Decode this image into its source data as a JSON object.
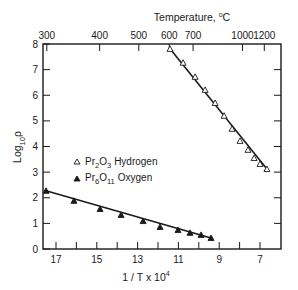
{
  "chart_data": {
    "type": "scatter",
    "title": "",
    "top_axis_label": "Temperature, °C",
    "top_axis_label_base": "Temperature, ",
    "top_axis_label_sup": "o",
    "top_axis_label_unit": "C",
    "top_ticks": [
      {
        "label": "300",
        "inv_T": 17.45
      },
      {
        "label": "400",
        "inv_T": 14.86
      },
      {
        "label": "500",
        "inv_T": 12.94
      },
      {
        "label": "600",
        "inv_T": 11.45
      },
      {
        "label": "700",
        "inv_T": 10.28
      },
      {
        "label": "1000",
        "inv_T": 7.86
      },
      {
        "label": "1200",
        "inv_T": 6.79
      }
    ],
    "xlabel": "1 / T x 10",
    "xlabel_sup": "4",
    "ylabel_base": "Log",
    "ylabel_sub": "10",
    "ylabel_sym": "ρ",
    "ylabel": "Log10 ρ",
    "xlim": [
      17.5,
      6.0
    ],
    "ylim": [
      0,
      8
    ],
    "x_ticks": [
      17,
      16,
      15,
      14,
      13,
      12,
      11,
      10,
      9,
      8,
      7
    ],
    "x_tick_labels": [
      "17",
      "15",
      "13",
      "11",
      "9",
      "7"
    ],
    "y_ticks": [
      0,
      1,
      2,
      3,
      4,
      5,
      6,
      7,
      8
    ],
    "y_tick_labels": [
      "0",
      "1",
      "2",
      "3",
      "4",
      "5",
      "6",
      "7",
      "8"
    ],
    "grid": false,
    "legend_position": "center-left",
    "series": [
      {
        "name": "Pr2O3 Hydrogen",
        "legend_formula": [
          "Pr",
          "2",
          "O",
          "3"
        ],
        "legend_gas": "Hydrogen",
        "marker": "open-triangle",
        "x": [
          11.41,
          10.77,
          10.18,
          9.69,
          9.2,
          8.76,
          8.37,
          7.98,
          7.59,
          7.29,
          7.0,
          6.66
        ],
        "y": [
          7.81,
          7.27,
          6.72,
          6.21,
          5.7,
          5.2,
          4.69,
          4.22,
          3.87,
          3.55,
          3.32,
          3.12
        ]
      },
      {
        "name": "Pr6O11 Oxygen",
        "legend_formula": [
          "Pr",
          "6",
          "O",
          "11"
        ],
        "legend_gas": "Oxygen",
        "marker": "filled-triangle",
        "x": [
          17.49,
          16.12,
          14.84,
          13.81,
          12.73,
          11.9,
          11.02,
          10.43,
          9.89,
          9.4
        ],
        "y": [
          2.27,
          1.88,
          1.56,
          1.33,
          1.09,
          0.86,
          0.74,
          0.63,
          0.55,
          0.43
        ]
      }
    ]
  }
}
